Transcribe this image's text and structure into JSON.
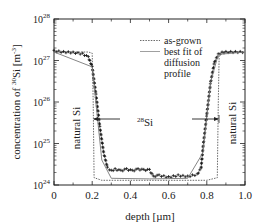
{
  "chart_data": {
    "type": "scatter",
    "title": "",
    "xlabel": "depth [µm]",
    "ylabel": "concentration of 30Si [m-3]",
    "ylabel_parts": {
      "pre": "concentration of ",
      "sup": "30",
      "mid": "Si [m",
      "sup2": "-3",
      "post": "]"
    },
    "xlim": [
      0,
      1.0
    ],
    "ylim": [
      1e+24,
      1e+28
    ],
    "yscale": "log",
    "x_ticks": [
      "0",
      "0.2",
      "0.4",
      "0.6",
      "0.8",
      "1.0"
    ],
    "y_ticks": [
      {
        "base": "10",
        "exp": "24"
      },
      {
        "base": "10",
        "exp": "25"
      },
      {
        "base": "10",
        "exp": "26"
      },
      {
        "base": "10",
        "exp": "27"
      },
      {
        "base": "10",
        "exp": "28"
      }
    ],
    "legend": [
      {
        "label": "as-grown",
        "style": "dotted"
      },
      {
        "label": "best fit of",
        "style": "solid"
      },
      {
        "label": "diffusion",
        "style": "none"
      },
      {
        "label": "profile",
        "style": "none"
      }
    ],
    "annotations": {
      "left_region": "natural Si",
      "right_region": "natural Si",
      "center_region_sup": "28",
      "center_region": "Si"
    },
    "series": [
      {
        "name": "as-grown",
        "style": "dotted",
        "x": [
          0.0,
          0.18,
          0.2,
          0.205,
          0.21,
          0.25,
          0.4,
          0.6,
          0.8,
          0.855,
          0.86,
          0.865,
          0.88,
          1.0
        ],
        "y": [
          1.6e+27,
          1.6e+27,
          1.5e+27,
          1e+26,
          1.5e+24,
          1.3e+24,
          1.3e+24,
          1.3e+24,
          1.3e+24,
          1.5e+24,
          1e+26,
          1.5e+27,
          1.6e+27,
          1.6e+27
        ]
      },
      {
        "name": "measured (crosses)",
        "style": "plus",
        "x": [
          0.0,
          0.05,
          0.1,
          0.15,
          0.18,
          0.2,
          0.22,
          0.24,
          0.26,
          0.28,
          0.3,
          0.32,
          0.35,
          0.38,
          0.41,
          0.44,
          0.47,
          0.5,
          0.52,
          0.55,
          0.6,
          0.65,
          0.7,
          0.75,
          0.77,
          0.78,
          0.8,
          0.82,
          0.84,
          0.86,
          0.88,
          0.9,
          0.95,
          1.0
        ],
        "y": [
          1.7e+27,
          1.6e+27,
          1.55e+27,
          1.45e+27,
          1.2e+27,
          7e+26,
          1.5e+26,
          2.5e+25,
          6e+24,
          2.6e+24,
          2.2e+24,
          2.4e+24,
          2.2e+24,
          2.4e+24,
          2.2e+24,
          2.4e+24,
          2.3e+24,
          2.3e+24,
          1.6e+24,
          1.7e+24,
          1.55e+24,
          1.7e+24,
          1.6e+24,
          1.8e+24,
          2.5e+24,
          8e+24,
          5e+25,
          3e+26,
          9e+26,
          1.4e+27,
          1.55e+27,
          1.6e+27,
          1.6e+27,
          1.6e+27
        ]
      },
      {
        "name": "best fit of diffusion profile",
        "style": "solid",
        "x": [
          0.0,
          0.2,
          0.25,
          0.3,
          0.5,
          0.7,
          0.78,
          0.82,
          0.86,
          1.0
        ],
        "y": [
          1.6e+27,
          7e+26,
          4e+24,
          1.45e+24,
          1.4e+24,
          1.45e+24,
          6e+24,
          3e+26,
          1.4e+27,
          1.6e+27
        ]
      }
    ]
  },
  "plot_geometry": {
    "left": 54,
    "right": 245,
    "top": 19,
    "bottom": 185
  }
}
